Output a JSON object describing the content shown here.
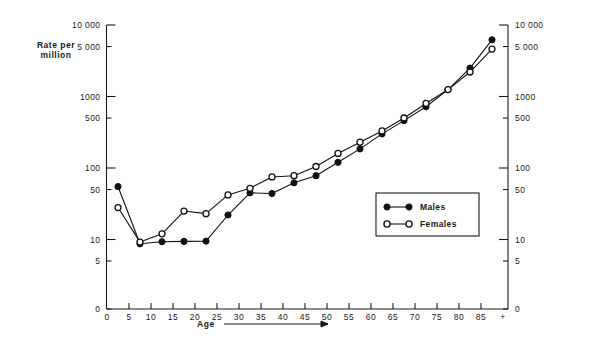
{
  "chart_data": {
    "type": "line",
    "title": "",
    "xlabel": "Age",
    "ylabel": "Rate per million",
    "ylabel_line1": "Rate per",
    "ylabel_line2": "million",
    "yscale": "log",
    "ylim": [
      3,
      10000
    ],
    "xlim": [
      0,
      92.5
    ],
    "grid": false,
    "legend_position": "center-right",
    "y_ticks": [
      {
        "value": 10000,
        "label": "10 000"
      },
      {
        "value": 5000,
        "label": "5 000"
      },
      {
        "value": 1000,
        "label": "1000"
      },
      {
        "value": 500,
        "label": "500"
      },
      {
        "value": 100,
        "label": "100"
      },
      {
        "value": 50,
        "label": "50"
      },
      {
        "value": 10,
        "label": "10"
      },
      {
        "value": 5,
        "label": "5"
      },
      {
        "value": 0,
        "label": "0"
      }
    ],
    "y_ticks_right": [
      {
        "value": 10000,
        "label": "10 000"
      },
      {
        "value": 5000,
        "label": "5 000"
      },
      {
        "value": 1000,
        "label": "1000"
      },
      {
        "value": 500,
        "label": "500"
      },
      {
        "value": 100,
        "label": "100"
      },
      {
        "value": 50,
        "label": "50"
      },
      {
        "value": 10,
        "label": "10"
      },
      {
        "value": 5,
        "label": "5"
      },
      {
        "value": 0,
        "label": "0"
      }
    ],
    "x_ticks": [
      {
        "value": 0,
        "label": "0"
      },
      {
        "value": 5,
        "label": "5"
      },
      {
        "value": 10,
        "label": "10"
      },
      {
        "value": 15,
        "label": "15"
      },
      {
        "value": 20,
        "label": "20"
      },
      {
        "value": 25,
        "label": "25"
      },
      {
        "value": 30,
        "label": "30"
      },
      {
        "value": 35,
        "label": "35"
      },
      {
        "value": 40,
        "label": "40"
      },
      {
        "value": 45,
        "label": "45"
      },
      {
        "value": 50,
        "label": "50"
      },
      {
        "value": 55,
        "label": "55"
      },
      {
        "value": 60,
        "label": "60"
      },
      {
        "value": 65,
        "label": "65"
      },
      {
        "value": 70,
        "label": "70"
      },
      {
        "value": 75,
        "label": "75"
      },
      {
        "value": 80,
        "label": "80"
      },
      {
        "value": 85,
        "label": "85"
      },
      {
        "value": 90,
        "label": "+"
      }
    ],
    "series": [
      {
        "name": "Males",
        "marker": "filled-circle",
        "x": [
          2.5,
          7.5,
          12.5,
          17.5,
          22.5,
          27.5,
          32.5,
          37.5,
          42.5,
          47.5,
          52.5,
          57.5,
          62.5,
          67.5,
          72.5,
          77.5,
          82.5,
          87.5
        ],
        "values": [
          55,
          8.7,
          9.3,
          9.4,
          9.5,
          22,
          45,
          44,
          62,
          78,
          120,
          185,
          300,
          460,
          720,
          1250,
          2500,
          6200
        ]
      },
      {
        "name": "Females",
        "marker": "open-circle",
        "x": [
          2.5,
          7.5,
          12.5,
          17.5,
          22.5,
          27.5,
          32.5,
          37.5,
          42.5,
          47.5,
          52.5,
          57.5,
          62.5,
          67.5,
          72.5,
          77.5,
          82.5,
          87.5
        ],
        "values": [
          28,
          9.2,
          12,
          25,
          23,
          42,
          52,
          75,
          78,
          105,
          160,
          230,
          330,
          500,
          800,
          1250,
          2200,
          4600
        ]
      }
    ]
  },
  "legend": {
    "entries": [
      {
        "label": "Males",
        "marker": "filled-circle"
      },
      {
        "label": "Females",
        "marker": "open-circle"
      }
    ]
  },
  "axis_labels": {
    "x_axis_title": "Age",
    "y_axis_title_line1": "Rate per",
    "y_axis_title_line2": "million"
  }
}
